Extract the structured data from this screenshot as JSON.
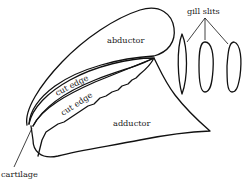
{
  "diagram": {
    "labels": {
      "abductor": "abductor",
      "cut_edge_upper": "cut edge",
      "cut_edge_lower": "cut edge",
      "adductor": "adductor",
      "gill_slits": "gill slits",
      "cartilage": "cartilage"
    },
    "colors": {
      "stroke": "#111111",
      "text": "#222222",
      "background": "#ffffff"
    }
  }
}
